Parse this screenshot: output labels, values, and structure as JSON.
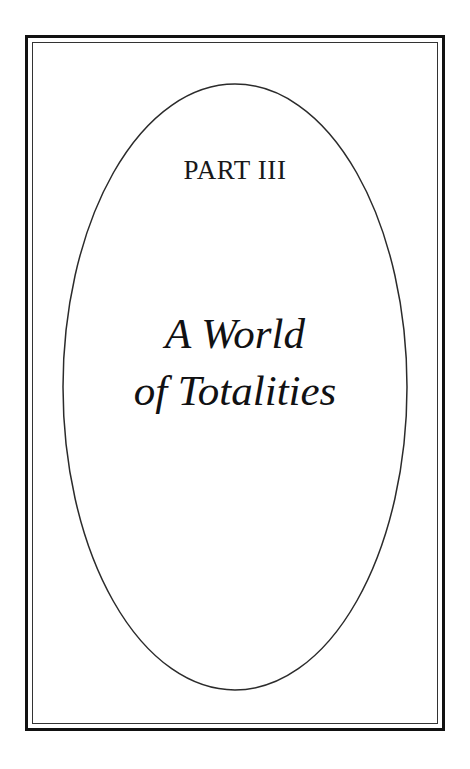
{
  "page": {
    "kind": "book-part-divider",
    "background_color": "#ffffff",
    "ink_color": "#111113"
  },
  "frame": {
    "outer_rule_color": "#111111",
    "inner_rule_color": "#333333",
    "style": "double-rule-rectangle"
  },
  "oval": {
    "name": "decorative-oval",
    "stroke_color": "#2b2b2b",
    "stroke_width": 1.5,
    "cx": 235,
    "cy": 387,
    "rx": 172,
    "ry": 303
  },
  "content": {
    "part_label": "PART III",
    "title_lines": [
      "A World",
      "of Totalities"
    ],
    "title_full": "A World of Totalities"
  }
}
